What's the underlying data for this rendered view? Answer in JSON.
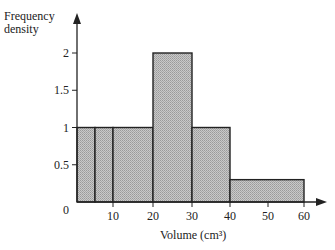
{
  "chart_data": {
    "type": "bar",
    "subtype": "histogram",
    "title": "",
    "xlabel": "Volume (cm³)",
    "ylabel_line1": "Frequency",
    "ylabel_line2": "density",
    "x_ticks": [
      0,
      10,
      20,
      30,
      40,
      50,
      60
    ],
    "y_ticks": [
      0.5,
      1,
      1.5,
      2
    ],
    "origin_label": "0",
    "xlim": [
      0,
      60
    ],
    "ylim": [
      0,
      2.4
    ],
    "grid": false,
    "legend": null,
    "bins": [
      {
        "start": 0,
        "end": 5,
        "frequency_density": 1
      },
      {
        "start": 5,
        "end": 10,
        "frequency_density": 1
      },
      {
        "start": 10,
        "end": 20,
        "frequency_density": 1
      },
      {
        "start": 20,
        "end": 30,
        "frequency_density": 2
      },
      {
        "start": 30,
        "end": 40,
        "frequency_density": 1
      },
      {
        "start": 40,
        "end": 60,
        "frequency_density": 0.3
      }
    ],
    "bar_fill": "#bdbdbd",
    "bar_stroke": "#222222"
  }
}
